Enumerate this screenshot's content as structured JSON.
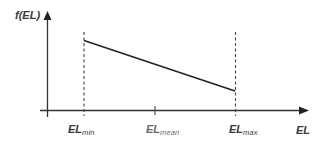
{
  "diagram": {
    "type": "piecewise-linear density plot",
    "y_axis": {
      "label": "f(EL)"
    },
    "x_axis": {
      "label": "EL"
    },
    "ticks": [
      {
        "id": "min",
        "main": "EL",
        "sub": "min",
        "x": 84
      },
      {
        "id": "mean",
        "main": "EL",
        "sub": "mean",
        "x": 155
      },
      {
        "id": "max",
        "main": "EL",
        "sub": "max",
        "x": 235
      }
    ],
    "segment": {
      "start": {
        "at": "EL_min",
        "value": "high"
      },
      "end": {
        "at": "EL_max",
        "value": "low"
      },
      "trend": "linearly decreasing"
    },
    "guides": [
      "dashed vertical at EL_min",
      "dashed vertical at EL_max"
    ]
  },
  "colors": {
    "ink": "#333333",
    "label": "#3a3a3a",
    "muted_label": "#6a6a6a",
    "background": "#ffffff"
  }
}
